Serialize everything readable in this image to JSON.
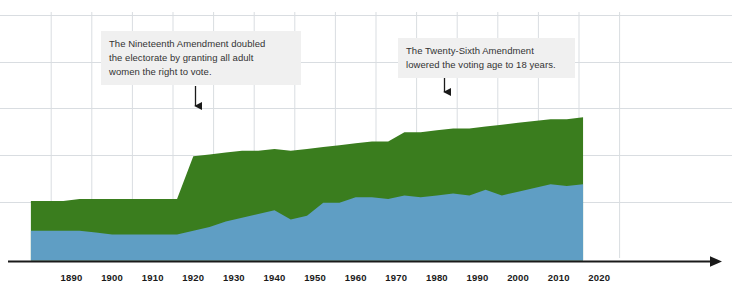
{
  "chart_data": {
    "type": "area",
    "title": "",
    "subtitle": "",
    "xlabel": "",
    "ylabel": "",
    "grid": true,
    "legend_position": "none",
    "stacked": true,
    "xlim": [
      1880,
      2020
    ],
    "ylim": [
      0,
      100
    ],
    "x": [
      1880,
      1884,
      1888,
      1892,
      1896,
      1900,
      1904,
      1908,
      1912,
      1916,
      1920,
      1924,
      1928,
      1932,
      1936,
      1940,
      1944,
      1948,
      1952,
      1956,
      1960,
      1964,
      1968,
      1972,
      1976,
      1980,
      1984,
      1988,
      1992,
      1996,
      2000,
      2004,
      2008,
      2012,
      2016
    ],
    "series": [
      {
        "name": "voted",
        "color": "#5f9ec4",
        "values": [
          16,
          16,
          16,
          16,
          15,
          14,
          14,
          14,
          14,
          14,
          16,
          18,
          21,
          23,
          25,
          27,
          22,
          24,
          31,
          31,
          34,
          34,
          33,
          35,
          34,
          35,
          36,
          35,
          38,
          35,
          37,
          39,
          41,
          40,
          41
        ]
      },
      {
        "name": "eligible-not-voted",
        "color": "#3a7d1e",
        "values": [
          16,
          16,
          16,
          17,
          18,
          19,
          19,
          19,
          19,
          19,
          40,
          39,
          37,
          36,
          34,
          33,
          37,
          36,
          30,
          31,
          29,
          30,
          31,
          34,
          35,
          35,
          35,
          36,
          34,
          38,
          37,
          36,
          35,
          36,
          36
        ]
      }
    ],
    "x_ticks": [
      1890,
      1900,
      1910,
      1920,
      1930,
      1940,
      1950,
      1960,
      1970,
      1980,
      1990,
      2000,
      2010,
      2020
    ],
    "annotations": [
      {
        "id": "nineteenth",
        "text": "The Nineteenth Amendment doubled\nthe electorate by granting all adult\nwomen the right to vote.",
        "pointer_year": 1920
      },
      {
        "id": "twentysixth",
        "text": "The Twenty-Sixth Amendment\nlowered the voting age to 18 years.",
        "pointer_year": 1972
      }
    ],
    "colors": {
      "voted": "#5f9ec4",
      "eligible_not_voted": "#3a7d1e",
      "grid": "#d9dde1",
      "axis": "#1a1a1a",
      "annotation_background": "#f0f0f0",
      "annotation_text": "#333333"
    }
  },
  "axis": {
    "tick_labels": [
      "1890",
      "1900",
      "1910",
      "1920",
      "1930",
      "1940",
      "1950",
      "1960",
      "1970",
      "1980",
      "1990",
      "2000",
      "2010",
      "2020"
    ]
  },
  "annotations": {
    "nineteenth": {
      "text": "The Nineteenth Amendment doubled\nthe electorate by granting all adult\nwomen the right to vote."
    },
    "twentysixth": {
      "text": "The Twenty-Sixth Amendment\nlowered the voting age to 18 years."
    }
  }
}
